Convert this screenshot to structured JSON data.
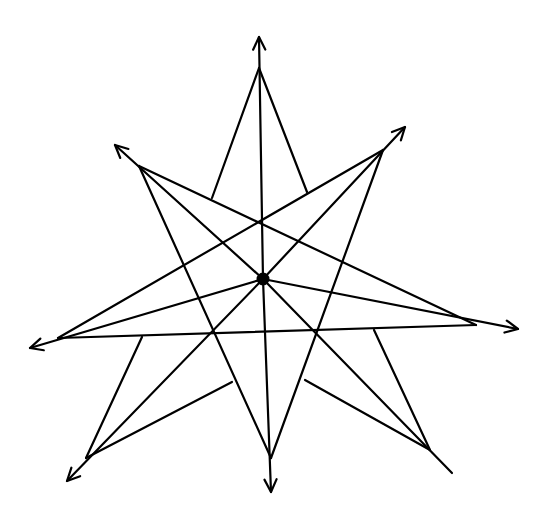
{
  "figure": {
    "stroke_color": "#000000",
    "background_color": "#ffffff",
    "center": {
      "name": "center"
    },
    "points": [
      {
        "name": "N",
        "arrow": true
      },
      {
        "name": "NE",
        "arrow": true
      },
      {
        "name": "E",
        "arrow": true
      },
      {
        "name": "SE",
        "arrow": false
      },
      {
        "name": "S",
        "arrow": true
      },
      {
        "name": "SW",
        "arrow": true
      },
      {
        "name": "W",
        "arrow": true
      },
      {
        "name": "NW",
        "arrow": true
      }
    ],
    "long_lines": [
      [
        "NW",
        "E"
      ],
      [
        "NE",
        "W"
      ],
      [
        "NW",
        "S"
      ],
      [
        "NE",
        "S"
      ],
      [
        "W",
        "E"
      ]
    ],
    "stub_lines": [
      {
        "from": "N",
        "onto": [
          "NW",
          "E"
        ]
      },
      {
        "from": "N",
        "onto": [
          "NE",
          "W"
        ]
      },
      {
        "from": "SW",
        "onto": [
          "W",
          "E"
        ]
      },
      {
        "from": "SW",
        "onto": [
          "NW",
          "S"
        ]
      },
      {
        "from": "SE",
        "onto": [
          "W",
          "E"
        ]
      },
      {
        "from": "SE",
        "onto": [
          "NE",
          "S"
        ]
      }
    ]
  }
}
